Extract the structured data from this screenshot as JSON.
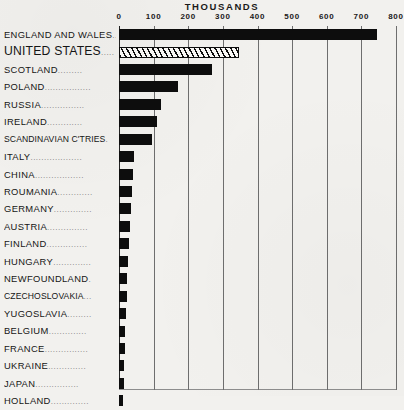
{
  "chart_data": {
    "type": "bar",
    "orientation": "horizontal",
    "title": "THOUSANDS",
    "xlabel": "THOUSANDS",
    "ylabel": "",
    "xlim": [
      0,
      800
    ],
    "grid": true,
    "legend": false,
    "xticks": [
      "0",
      "100",
      "200",
      "300",
      "400",
      "500",
      "600",
      "700",
      "800"
    ],
    "xtick_values": [
      0,
      100,
      200,
      300,
      400,
      500,
      600,
      700,
      800
    ],
    "categories": [
      "ENGLAND AND WALES",
      "UNITED STATES",
      "SCOTLAND",
      "POLAND",
      "RUSSIA",
      "IRELAND",
      "SCANDINAVIAN C'TRIES",
      "ITALY",
      "CHINA",
      "ROUMANIA",
      "GERMANY",
      "AUSTRIA",
      "FINLAND",
      "HUNGARY",
      "NEWFOUNDLAND",
      "CZECHOSLOVAKIA",
      "YUGOSLAVIA",
      "BELGIUM",
      "FRANCE",
      "UKRAINE",
      "JAPAN",
      "HOLLAND"
    ],
    "values": [
      745,
      342,
      270,
      170,
      120,
      110,
      96,
      44,
      41,
      38,
      35,
      32,
      29,
      27,
      24,
      22,
      20,
      18,
      16,
      14,
      13,
      11
    ],
    "highlight_index": 1,
    "highlight_style": "hatched",
    "bar_color": "#0d0d0d",
    "grid_color": "#6e6e6e",
    "background_color": "#f2f1ee"
  },
  "rows": [
    {
      "label": "ENGLAND AND WALES",
      "leader": "..",
      "value": 745,
      "style": "solid",
      "size": "normal"
    },
    {
      "label": "UNITED STATES",
      "leader": ".....",
      "value": 342,
      "style": "hatched",
      "size": "big"
    },
    {
      "label": "SCOTLAND",
      "leader": ".........",
      "value": 270,
      "style": "solid",
      "size": "normal"
    },
    {
      "label": "POLAND",
      "leader": ".................",
      "value": 170,
      "style": "solid",
      "size": "normal"
    },
    {
      "label": "RUSSIA",
      "leader": "................",
      "value": 120,
      "style": "solid",
      "size": "normal"
    },
    {
      "label": "IRELAND",
      "leader": ".............",
      "value": 110,
      "style": "solid",
      "size": "normal"
    },
    {
      "label": "SCANDINAVIAN C'TRIES",
      "leader": ".",
      "value": 96,
      "style": "solid",
      "size": "wide"
    },
    {
      "label": "ITALY",
      "leader": "...................",
      "value": 44,
      "style": "solid",
      "size": "normal"
    },
    {
      "label": "CHINA",
      "leader": "..................",
      "value": 41,
      "style": "solid",
      "size": "normal"
    },
    {
      "label": "ROUMANIA",
      "leader": ".............",
      "value": 38,
      "style": "solid",
      "size": "normal"
    },
    {
      "label": "GERMANY",
      "leader": "..............",
      "value": 35,
      "style": "solid",
      "size": "normal"
    },
    {
      "label": "AUSTRIA",
      "leader": "...............",
      "value": 32,
      "style": "solid",
      "size": "normal"
    },
    {
      "label": "FINLAND",
      "leader": "...............",
      "value": 29,
      "style": "solid",
      "size": "normal"
    },
    {
      "label": "HUNGARY",
      "leader": "..............",
      "value": 27,
      "style": "solid",
      "size": "normal"
    },
    {
      "label": "NEWFOUNDLAND",
      "leader": ".",
      "value": 24,
      "style": "solid",
      "size": "normal"
    },
    {
      "label": "CZECHOSLOVAKIA",
      "leader": "...",
      "value": 22,
      "style": "solid",
      "size": "wide"
    },
    {
      "label": "YUGOSLAVIA",
      "leader": ".........",
      "value": 20,
      "style": "solid",
      "size": "normal"
    },
    {
      "label": "BELGIUM",
      "leader": "..............",
      "value": 18,
      "style": "solid",
      "size": "normal"
    },
    {
      "label": "FRANCE",
      "leader": "................",
      "value": 16,
      "style": "solid",
      "size": "normal"
    },
    {
      "label": "UKRAINE",
      "leader": "..............",
      "value": 14,
      "style": "solid",
      "size": "normal"
    },
    {
      "label": "JAPAN",
      "leader": "................",
      "value": 13,
      "style": "solid",
      "size": "normal"
    },
    {
      "label": "HOLLAND",
      "leader": "..............",
      "value": 11,
      "style": "solid",
      "size": "normal"
    }
  ]
}
